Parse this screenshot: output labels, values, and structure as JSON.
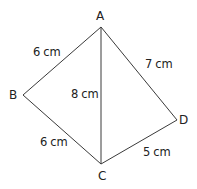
{
  "diagram": {
    "type": "quadrilateral-with-diagonal",
    "line_color": "#3a3a3a",
    "text_color": "#222222",
    "vertices": {
      "A": {
        "label": "A",
        "x": 101,
        "y": 27
      },
      "B": {
        "label": "B",
        "x": 23,
        "y": 95
      },
      "C": {
        "label": "C",
        "x": 101,
        "y": 164
      },
      "D": {
        "label": "D",
        "x": 177,
        "y": 120
      }
    },
    "edges": {
      "AB": {
        "label": "6 cm"
      },
      "BC": {
        "label": "6 cm"
      },
      "AC": {
        "label": "8 cm"
      },
      "AD": {
        "label": "7 cm"
      },
      "CD": {
        "label": "5 cm"
      }
    }
  }
}
